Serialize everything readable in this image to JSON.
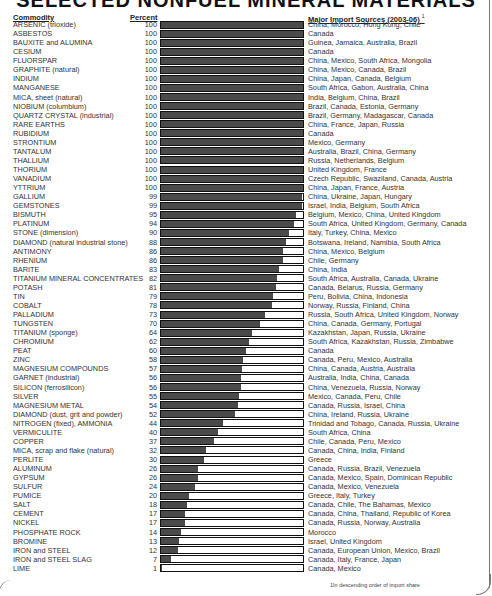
{
  "title": "SELECTED NONFUEL MINERAL MATERIALS",
  "headers": {
    "commodity": "Commodity",
    "percent": "Percent",
    "sources": "Major Import Sources (2003-06)",
    "sources_note_mark": "1"
  },
  "footnote": "1In descending order of import share",
  "colors": {
    "bar_fill": "#4a4a4a",
    "bar_border": "#111111",
    "bar_empty": "#ffffff"
  },
  "chart_data": {
    "type": "bar",
    "orientation": "horizontal",
    "title": "SELECTED NONFUEL MINERAL MATERIALS",
    "xlabel": "Percent",
    "ylabel": "Commodity",
    "xlim": [
      0,
      100
    ],
    "grid": false,
    "categories": [
      "ARSENIC (trioxide)",
      "ASBESTOS",
      "BAUXITE and ALUMINA",
      "CESIUM",
      "FLUORSPAR",
      "GRAPHITE (natural)",
      "INDIUM",
      "MANGANESE",
      "MICA, sheet (natural)",
      "NIOBIUM (columbium)",
      "QUARTZ CRYSTAL (industrial)",
      "RARE EARTHS",
      "RUBIDIUM",
      "STRONTIUM",
      "TANTALUM",
      "THALLIUM",
      "THORIUM",
      "VANADIUM",
      "YTTRIUM",
      "GALLIUM",
      "GEMSTONES",
      "BISMUTH",
      "PLATINUM",
      "STONE (dimension)",
      "DIAMOND (natural industrial stone)",
      "ANTIMONY",
      "RHENIUM",
      "BARITE",
      "TITANIUM MINERAL CONCENTRATES",
      "POTASH",
      "TIN",
      "COBALT",
      "PALLADIUM",
      "TUNGSTEN",
      "TITANIUM (sponge)",
      "CHROMIUM",
      "PEAT",
      "ZINC",
      "MAGNESIUM COMPOUNDS",
      "GARNET (industrial)",
      "SILICON (ferrosilicon)",
      "SILVER",
      "MAGNESIUM METAL",
      "DIAMOND (dust, grit and powder)",
      "NITROGEN (fixed), AMMONIA",
      "VERMICULITE",
      "COPPER",
      "MICA, scrap and flake (natural)",
      "PERLITE",
      "ALUMINUM",
      "GYPSUM",
      "SULFUR",
      "PUMICE",
      "SALT",
      "CEMENT",
      "NICKEL",
      "PHOSPHATE ROCK",
      "BROMINE",
      "IRON and STEEL",
      "IRON and STEEL SLAG",
      "LIME"
    ],
    "values": [
      100,
      100,
      100,
      100,
      100,
      100,
      100,
      100,
      100,
      100,
      100,
      100,
      100,
      100,
      100,
      100,
      100,
      100,
      100,
      99,
      99,
      95,
      94,
      90,
      88,
      86,
      86,
      83,
      82,
      81,
      79,
      78,
      73,
      70,
      64,
      62,
      60,
      58,
      57,
      56,
      56,
      55,
      54,
      52,
      44,
      40,
      37,
      32,
      30,
      26,
      26,
      24,
      20,
      18,
      17,
      17,
      14,
      13,
      12,
      7,
      1
    ],
    "sources": [
      "China, Morocco, Hong Kong, Chile",
      "Canada",
      "Guinea, Jamaica, Australia, Brazil",
      "Canada",
      "China, Mexico, South Africa, Mongolia",
      "China, Mexico, Canada, Brazil",
      "China, Japan, Canada, Belgium",
      "South Africa, Gabon, Australia, China",
      "India, Belgium, China, Brazil",
      "Brazil, Canada, Estonia, Germany",
      "Brazil, Germany, Madagascar, Canada",
      "China, France, Japan, Russia",
      "Canada",
      "Mexico, Germany",
      "Australia, Brazil, China, Germany",
      "Russia, Netherlands, Belgium",
      "United Kingdom, France",
      "Czech Republic, Swaziland, Canada, Austria",
      "China, Japan, France, Austria",
      "China, Ukraine, Japan, Hungary",
      "Israel, India, Belgium, South Africa",
      "Belgium, Mexico, China, United Kingdom",
      "South Africa, United Kingdom, Germany, Canada",
      "Italy, Turkey, China, Mexico",
      "Botswana, Ireland, Namibia, South Africa",
      "China, Mexico, Belgium",
      "Chile, Germany",
      "China, India",
      "South Africa, Australia, Canada, Ukraine",
      "Canada, Belarus, Russia, Germany",
      "Peru, Bolivia, China, Indonesia",
      "Norway, Russia, Finland, China",
      "Russia, South Africa, United Kingdom, Norway",
      "China, Canada, Germany, Portugal",
      "Kazakhstan, Japan, Russia, Ukraine",
      "South Africa, Kazakhstan, Russia, Zimbabwe",
      "Canada",
      "Canada, Peru, Mexico, Australia",
      "China, Canada, Austria, Australia",
      "Australia, India, China, Canada",
      "China, Venezuela, Russia, Norway",
      "Mexico, Canada, Peru, Chile",
      "Canada, Russia, Israel, China",
      "China, Ireland, Russia, Ukraine",
      "Trinidad and Tobago, Canada, Russia, Ukraine",
      "South Africa, China",
      "Chile, Canada, Peru, Mexico",
      "Canada, China, India, Finland",
      "Greece",
      "Canada, Russia, Brazil, Venezuela",
      "Canada, Mexico, Spain, Dominican Republic",
      "Canada, Mexico, Venezuela",
      "Greece, Italy, Turkey",
      "Canada, Chile, The Bahamas, Mexico",
      "Canada, China, Thailand, Republic of Korea",
      "Canada, Russia, Norway, Australia",
      "Morocco",
      "Israel, United Kingdom",
      "Canada, European Union, Mexico, Brazil",
      "Canada, Italy, France, Japan",
      "Canada, Mexico"
    ]
  }
}
